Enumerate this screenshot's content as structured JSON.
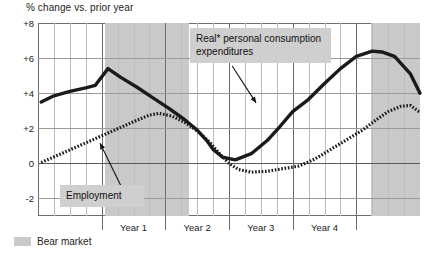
{
  "chart_data": {
    "type": "line",
    "title": "",
    "ylabel": "% change vs. prior year",
    "xlabel": "",
    "ylim": [
      -3,
      8
    ],
    "xlim": [
      0,
      20
    ],
    "grid": true,
    "legend_position": "below-left",
    "y_ticks": [
      {
        "value": 8,
        "label": "+8"
      },
      {
        "value": 6,
        "label": "+6"
      },
      {
        "value": 4,
        "label": "+4"
      },
      {
        "value": 2,
        "label": "+2"
      },
      {
        "value": 0,
        "label": "0"
      },
      {
        "value": -2,
        "label": "-2"
      }
    ],
    "x_ticks": [
      {
        "value": 4,
        "label": ""
      },
      {
        "value": 8,
        "label": ""
      },
      {
        "value": 12,
        "label": ""
      },
      {
        "value": 16,
        "label": ""
      },
      {
        "value": 20,
        "label": ""
      }
    ],
    "x_period_labels": [
      {
        "label": "Year 1",
        "center": 6
      },
      {
        "label": "Year 2",
        "center": 10
      },
      {
        "label": "Year 3",
        "center": 14
      },
      {
        "label": "Year 4",
        "center": 18
      }
    ],
    "shaded_regions": [
      {
        "name": "Bear market",
        "x_start": 4.2,
        "x_end": 9.5,
        "color": "#c9c9c9"
      },
      {
        "name": "Bear market",
        "x_start": 20.9,
        "x_end": 24.0,
        "color": "#c9c9c9"
      }
    ],
    "series": [
      {
        "name": "Real* personal consumption expenditures",
        "style": "solid",
        "color": "#1a1a1a",
        "x": [
          0.2,
          1.0,
          2.0,
          3.0,
          3.6,
          4.4,
          5.2,
          6.2,
          7.2,
          8.2,
          9.2,
          10.0,
          10.6,
          11.0,
          11.6,
          12.4,
          13.4,
          14.4,
          15.2,
          16.0,
          17.0,
          18.0,
          19.0,
          20.0,
          21.0,
          21.6,
          22.4,
          23.4,
          24.0
        ],
        "y": [
          3.5,
          3.85,
          4.1,
          4.3,
          4.45,
          5.4,
          4.9,
          4.35,
          3.75,
          3.15,
          2.5,
          1.9,
          1.3,
          0.8,
          0.35,
          0.2,
          0.55,
          1.3,
          2.1,
          2.95,
          3.65,
          4.55,
          5.4,
          6.1,
          6.4,
          6.35,
          6.1,
          5.1,
          4.0
        ]
      },
      {
        "name": "Employment",
        "style": "dotted",
        "color": "#1a1a1a",
        "x": [
          0.2,
          1.2,
          2.2,
          3.2,
          4.2,
          5.2,
          6.2,
          7.0,
          7.6,
          8.4,
          9.2,
          10.0,
          10.8,
          11.4,
          12.0,
          12.6,
          13.4,
          14.4,
          15.4,
          16.4,
          17.4,
          18.4,
          19.4,
          20.4,
          21.2,
          22.0,
          22.8,
          23.4,
          24.0
        ],
        "y": [
          0.05,
          0.45,
          0.85,
          1.25,
          1.65,
          2.05,
          2.45,
          2.75,
          2.85,
          2.7,
          2.35,
          1.85,
          1.2,
          0.55,
          0.0,
          -0.35,
          -0.5,
          -0.45,
          -0.3,
          -0.15,
          0.25,
          0.8,
          1.35,
          1.9,
          2.45,
          2.95,
          3.25,
          3.3,
          2.9
        ]
      }
    ],
    "annotations": [
      {
        "name": "pce-callout",
        "text": "Real* personal consumption\nexpenditures",
        "box_color": "#cfcfcf",
        "arrow_from": [
          12.2,
          5.55
        ],
        "arrow_to": [
          13.7,
          3.45
        ]
      },
      {
        "name": "employment-callout",
        "text": "Employment",
        "box_color": "#cfcfcf",
        "arrow_from": [
          5.3,
          -1.45
        ],
        "arrow_to": [
          3.9,
          1.15
        ]
      }
    ],
    "legend": [
      {
        "label": "Bear market",
        "swatch_color": "#c9c9c9",
        "type": "area"
      }
    ]
  }
}
